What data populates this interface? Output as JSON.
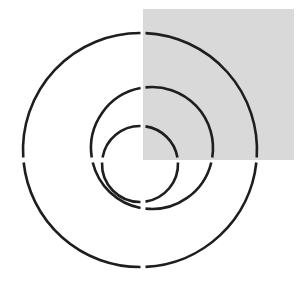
{
  "diagram": {
    "background": "#ffffff",
    "square": {
      "x": 143,
      "y": 9,
      "width": 151,
      "height": 151,
      "fill": "#d9d9d9"
    },
    "stroke": {
      "color": "#1e1e1e",
      "width": 2.6
    },
    "gap_lines": {
      "vertical_x": 143,
      "horizontal_y": 160,
      "gap": 5
    },
    "circles": [
      {
        "name": "outer-circle",
        "cx": 140,
        "cy": 150,
        "r": 117
      },
      {
        "name": "middle-circle",
        "cx": 152,
        "cy": 148,
        "r": 61
      },
      {
        "name": "inner-circle",
        "cx": 140,
        "cy": 164,
        "r": 38
      }
    ]
  }
}
